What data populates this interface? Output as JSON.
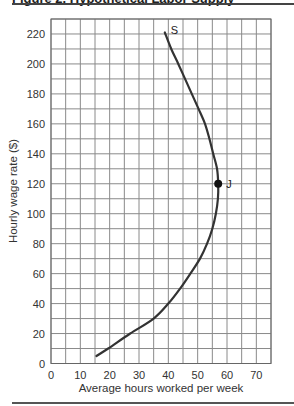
{
  "figure": {
    "title_clipped": "Figure 2.   Hypothetical Labor Supply"
  },
  "chart_data": {
    "type": "line",
    "title": "",
    "xlabel": "Average hours worked per week",
    "ylabel": "Hourly wage rate ($)",
    "xlim": [
      0,
      75
    ],
    "ylim": [
      0,
      230
    ],
    "x_ticks": [
      0,
      10,
      20,
      30,
      40,
      50,
      60,
      70
    ],
    "y_ticks": [
      0,
      20,
      40,
      60,
      80,
      100,
      120,
      140,
      160,
      180,
      200,
      220
    ],
    "grid": true,
    "grid_step_x": 5,
    "grid_step_y": 10,
    "series": [
      {
        "name": "S",
        "color": "#333333",
        "points": [
          [
            15.5,
            5
          ],
          [
            19.5,
            10
          ],
          [
            27,
            20
          ],
          [
            35,
            30
          ],
          [
            40,
            40
          ],
          [
            44,
            50
          ],
          [
            47.5,
            60
          ],
          [
            50.8,
            70
          ],
          [
            53.2,
            80
          ],
          [
            55,
            90
          ],
          [
            56.2,
            100
          ],
          [
            56.9,
            110
          ],
          [
            57,
            120
          ],
          [
            56.6,
            130
          ],
          [
            55.3,
            140
          ],
          [
            54,
            150
          ],
          [
            52.5,
            160
          ],
          [
            50.3,
            170
          ],
          [
            48,
            180
          ],
          [
            45.7,
            190
          ],
          [
            43.4,
            200
          ],
          [
            41,
            210
          ],
          [
            38.8,
            221
          ]
        ]
      }
    ],
    "annotations": [
      {
        "label": "S",
        "x": 38.8,
        "y": 221,
        "type": "curve-label"
      },
      {
        "label": "J",
        "x": 57,
        "y": 120,
        "type": "marked-point"
      }
    ]
  }
}
